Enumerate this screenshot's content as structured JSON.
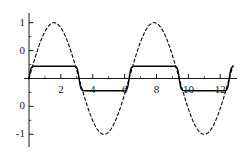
{
  "chart_data": {
    "type": "line",
    "title": "",
    "subtitle": "",
    "xlabel": "",
    "ylabel": "",
    "xlim": [
      0,
      12.8
    ],
    "ylim": [
      -1.12,
      1.12
    ],
    "grid": false,
    "legend": null,
    "legend_position": "none",
    "background": "#ffffff",
    "axis_color": "#000000",
    "x_ticks": [
      {
        "value": 2,
        "label": "2"
      },
      {
        "value": 4,
        "label": "4"
      },
      {
        "value": 6,
        "label": "6"
      },
      {
        "value": 8,
        "label": "8"
      },
      {
        "value": 10,
        "label": "10"
      },
      {
        "value": 12,
        "label": "12"
      }
    ],
    "y_ticks": [
      {
        "value": 1,
        "label": "1"
      },
      {
        "value": 0.5,
        "label": "0"
      },
      {
        "value": -0.5,
        "label": "0"
      },
      {
        "value": -1,
        "label": "-1"
      }
    ],
    "x_minor_ticks": [
      1,
      3,
      5,
      7,
      9,
      11
    ],
    "y_minor_ticks": [
      0.75,
      0.25,
      -0.25,
      -0.75
    ],
    "series": [
      {
        "name": "dashed-wave",
        "style": "dashed",
        "color": "#000000",
        "width": 1.1,
        "dash": "3,2.6",
        "amplitude": 1.0,
        "period": 6.2832,
        "phase": 0,
        "formula": "sin(x)",
        "x": [
          0,
          0.3,
          0.6,
          0.9,
          1.2,
          1.5708,
          1.9,
          2.3,
          2.7,
          3.1416,
          3.6,
          4.0,
          4.4,
          4.7124,
          5.1,
          5.5,
          5.9,
          6.2832,
          6.7,
          7.1,
          7.5,
          7.854,
          8.2,
          8.6,
          9.0,
          9.4248,
          9.9,
          10.3,
          10.7,
          10.9956,
          11.4,
          11.8,
          12.2,
          12.5664,
          12.8
        ],
        "y": [
          0,
          0.2955,
          0.5646,
          0.7833,
          0.932,
          1.0,
          0.9463,
          0.7457,
          0.4274,
          0,
          -0.4425,
          -0.7568,
          -0.9516,
          -1.0,
          -0.9258,
          -0.7055,
          -0.3739,
          0,
          0.4048,
          0.729,
          0.938,
          1.0,
          0.9407,
          0.7344,
          0.4121,
          0,
          -0.4538,
          -0.7654,
          -0.956,
          -1.0,
          -0.9162,
          -0.6878,
          -0.3508,
          0,
          0.2272
        ]
      },
      {
        "name": "solid-wave",
        "style": "solid",
        "color": "#000000",
        "width": 1.4,
        "dash": "none",
        "amplitude": 0.22,
        "period": 6.2832,
        "phase": 0,
        "formula": "flattened sin(x), amplitude 0.22",
        "x": [
          0,
          0.3,
          0.6,
          0.9,
          1.2,
          1.5708,
          1.9,
          2.3,
          2.7,
          3.1416,
          3.6,
          4.0,
          4.4,
          4.7124,
          5.1,
          5.5,
          5.9,
          6.2832,
          6.7,
          7.1,
          7.5,
          7.854,
          8.2,
          8.6,
          9.0,
          9.4248,
          9.9,
          10.3,
          10.7,
          10.9956,
          11.4,
          11.8,
          12.2,
          12.5664,
          12.8
        ],
        "y": [
          0,
          0.1829,
          0.2195,
          0.2207,
          0.2203,
          0.22,
          0.2206,
          0.2213,
          0.2153,
          0,
          -0.2171,
          -0.2207,
          -0.2203,
          -0.22,
          -0.2204,
          -0.221,
          -0.2071,
          0,
          0.2139,
          0.2205,
          0.2202,
          0.22,
          0.2204,
          0.2209,
          0.2118,
          0,
          -0.2188,
          -0.2206,
          -0.2202,
          -0.22,
          -0.2205,
          -0.2212,
          -0.1983,
          0,
          0.1504
        ]
      }
    ]
  },
  "figure": {
    "width": 238,
    "height": 154
  }
}
